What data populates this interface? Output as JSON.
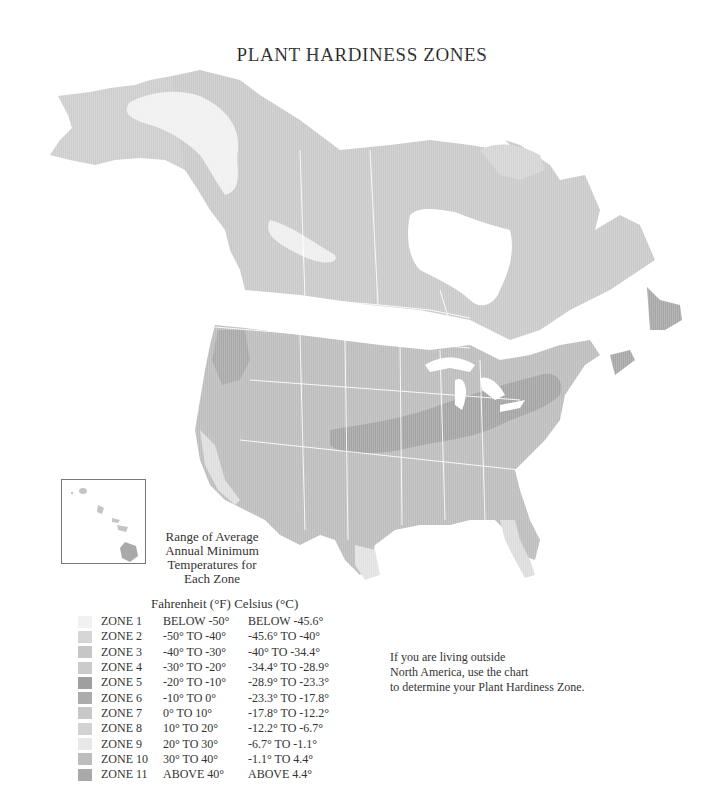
{
  "title": "PLANT HARDINESS ZONES",
  "range_caption": [
    "Range of Average",
    "Annual Minimum",
    "Temperatures for",
    "Each Zone"
  ],
  "legend": {
    "header_f": "Fahrenheit (°F)",
    "header_c": "Celsius (°C)",
    "zones": [
      {
        "zone": "ZONE 1",
        "fahrenheit": "BELOW -50°",
        "celsius": "BELOW -45.6°",
        "color": "#f1f1f1"
      },
      {
        "zone": "ZONE 2",
        "fahrenheit": "-50° TO -40°",
        "celsius": "-45.6° TO -40°",
        "color": "#d6d6d6"
      },
      {
        "zone": "ZONE 3",
        "fahrenheit": "-40° TO -30°",
        "celsius": "-40° TO -34.4°",
        "color": "#c6c6c6"
      },
      {
        "zone": "ZONE 4",
        "fahrenheit": "-30° TO -20°",
        "celsius": "-34.4° TO -28.9°",
        "color": "#cbcbcb"
      },
      {
        "zone": "ZONE 5",
        "fahrenheit": "-20° TO -10°",
        "celsius": "-28.9° TO -23.3°",
        "color": "#9f9f9f"
      },
      {
        "zone": "ZONE 6",
        "fahrenheit": "-10° TO   0°",
        "celsius": "-23.3° TO -17.8°",
        "color": "#acacac"
      },
      {
        "zone": "ZONE 7",
        "fahrenheit": "0° TO  10°",
        "celsius": "-17.8° TO -12.2°",
        "color": "#c8c8c8"
      },
      {
        "zone": "ZONE 8",
        "fahrenheit": "10° TO  20°",
        "celsius": "-12.2° TO -6.7°",
        "color": "#d2d2d2"
      },
      {
        "zone": "ZONE 9",
        "fahrenheit": "20° TO  30°",
        "celsius": "-6.7° TO -1.1°",
        "color": "#e8e8e8"
      },
      {
        "zone": "ZONE 10",
        "fahrenheit": "30° TO  40°",
        "celsius": "-1.1° TO 4.4°",
        "color": "#bdbdbd"
      },
      {
        "zone": "ZONE 11",
        "fahrenheit": "ABOVE 40°",
        "celsius": "ABOVE 4.4°",
        "color": "#a9a9a9"
      }
    ]
  },
  "note": [
    "If you are living outside",
    "North America, use the chart",
    "to determine your Plant Hardiness Zone."
  ],
  "insets": {
    "hawaii": "Hawaii"
  }
}
